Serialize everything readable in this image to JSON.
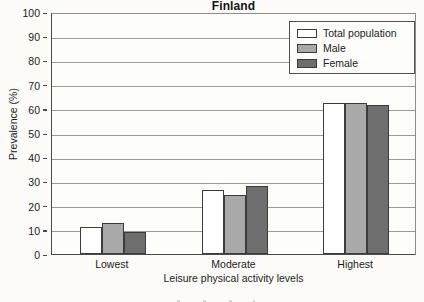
{
  "chart_data": {
    "type": "bar",
    "title": "Finland",
    "xlabel": "Leisure physical activity levels",
    "ylabel": "Prevalence (%)",
    "categories": [
      "Lowest",
      "Moderate",
      "Highest"
    ],
    "series": [
      {
        "name": "Total population",
        "values": [
          11,
          26.5,
          62.5
        ],
        "color": "#ffffff"
      },
      {
        "name": "Male",
        "values": [
          13,
          24.5,
          62.5
        ],
        "color": "#a9a9a9"
      },
      {
        "name": "Female",
        "values": [
          9,
          28,
          61.5
        ],
        "color": "#6e6e6e"
      }
    ],
    "ylim": [
      0,
      100
    ],
    "yticks": [
      0,
      10,
      20,
      30,
      40,
      50,
      60,
      70,
      80,
      90,
      100
    ],
    "yticklabels": [
      "0",
      "10",
      "20",
      "30",
      "40",
      "50",
      "60",
      "70",
      "80",
      "90",
      "100"
    ],
    "grid": true,
    "legend_position": "top-right"
  },
  "legend": {
    "entries": [
      {
        "label": "Total population",
        "swatch": "total"
      },
      {
        "label": "Male",
        "swatch": "male"
      },
      {
        "label": "Female",
        "swatch": "female"
      }
    ]
  }
}
